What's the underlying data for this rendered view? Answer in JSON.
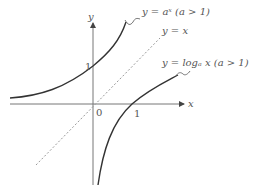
{
  "diagram": {
    "axes": {
      "x_label": "x",
      "y_label": "y",
      "origin_label": "0",
      "x_tick_label": "1",
      "y_tick_label": "1"
    },
    "curves": [
      {
        "name": "exponential",
        "label": "y = aˣ (a > 1)",
        "style": "solid"
      },
      {
        "name": "identity",
        "label": "y = x",
        "style": "dotted"
      },
      {
        "name": "logarithm",
        "label": "y = logₐ x (a > 1)",
        "style": "solid"
      }
    ],
    "colors": {
      "axis": "#555555",
      "curve": "#333333",
      "dotted": "#999999",
      "text": "#555555"
    }
  }
}
